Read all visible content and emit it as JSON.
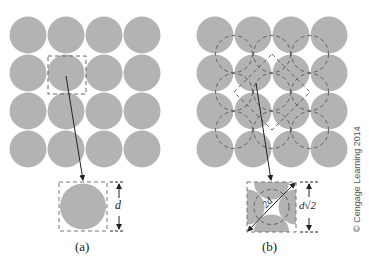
{
  "figure": {
    "panel_a": {
      "caption": "(a)",
      "dimension_label": "d",
      "grid": {
        "rows": 4,
        "cols": 4,
        "description": "simple square packing of circles"
      }
    },
    "panel_b": {
      "caption": "(b)",
      "dimension_label": "d√2",
      "diagonal_label": "2d",
      "grid": {
        "rows": 4,
        "cols": 4,
        "description": "square packing with dashed circles at interstitial sites"
      }
    },
    "credit": "© Cengage Learning 2014",
    "colors": {
      "disc": "#b3b3b3",
      "dash": "#555555",
      "arrow": "#222222"
    }
  }
}
